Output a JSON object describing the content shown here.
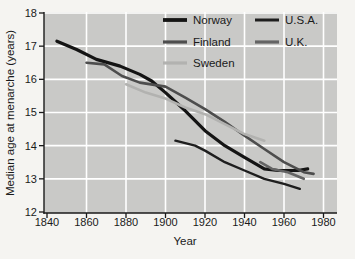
{
  "figure_title": "Secular trend in median age at menarche",
  "axes": {
    "y_title": "Median age at menarche (years)",
    "x_title": "Year",
    "y_ticks": [
      12,
      13,
      14,
      15,
      16,
      17,
      18
    ],
    "x_ticks": [
      1840,
      1860,
      1880,
      1900,
      1920,
      1940,
      1960,
      1980
    ]
  },
  "colors": {
    "plot_background": "#c9c9c7",
    "page_background": "#f5f4f1",
    "gridline": "#ffffff",
    "axis": "#1a1a1a",
    "norway": "#141414",
    "finland": "#4d4d4d",
    "sweden": "#b2b2b0",
    "usa": "#1e1e1e",
    "uk": "#646464"
  },
  "legend": {
    "items": [
      {
        "label": "Norway",
        "series": "Norway",
        "col": 0,
        "row": 0
      },
      {
        "label": "Finland",
        "series": "Finland",
        "col": 0,
        "row": 1
      },
      {
        "label": "Sweden",
        "series": "Sweden",
        "col": 0,
        "row": 2
      },
      {
        "label": "U.S.A.",
        "series": "U.S.A.",
        "col": 1,
        "row": 0
      },
      {
        "label": "U.K.",
        "series": "U.K.",
        "col": 1,
        "row": 1
      }
    ]
  },
  "chart_data": {
    "type": "line",
    "title": "",
    "xlabel": "Year",
    "ylabel": "Median age at menarche (years)",
    "xlim": [
      1838,
      1987
    ],
    "ylim": [
      12,
      18
    ],
    "grid": true,
    "legend_position": "top-inside-two-columns",
    "series": [
      {
        "name": "Norway",
        "color": "#141414",
        "stroke_width": 3.2,
        "points": [
          [
            1845,
            17.15
          ],
          [
            1855,
            16.9
          ],
          [
            1865,
            16.6
          ],
          [
            1877,
            16.4
          ],
          [
            1887,
            16.15
          ],
          [
            1893,
            15.95
          ],
          [
            1900,
            15.6
          ],
          [
            1910,
            15.05
          ],
          [
            1920,
            14.45
          ],
          [
            1930,
            14.0
          ],
          [
            1940,
            13.65
          ],
          [
            1950,
            13.3
          ],
          [
            1957,
            13.25
          ],
          [
            1967,
            13.25
          ],
          [
            1972,
            13.3
          ]
        ]
      },
      {
        "name": "Finland",
        "color": "#4d4d4d",
        "stroke_width": 2.6,
        "points": [
          [
            1860,
            16.5
          ],
          [
            1869,
            16.45
          ],
          [
            1878,
            16.1
          ],
          [
            1887,
            15.9
          ],
          [
            1900,
            15.78
          ],
          [
            1910,
            15.45
          ],
          [
            1920,
            15.1
          ],
          [
            1930,
            14.72
          ],
          [
            1940,
            14.3
          ],
          [
            1950,
            13.9
          ],
          [
            1960,
            13.5
          ],
          [
            1970,
            13.2
          ],
          [
            1975,
            13.15
          ]
        ]
      },
      {
        "name": "Sweden",
        "color": "#b2b2b0",
        "stroke_width": 2.6,
        "points": [
          [
            1880,
            15.85
          ],
          [
            1890,
            15.6
          ],
          [
            1900,
            15.42
          ],
          [
            1910,
            15.15
          ],
          [
            1920,
            14.95
          ],
          [
            1930,
            14.65
          ],
          [
            1940,
            14.35
          ],
          [
            1950,
            14.15
          ]
        ]
      },
      {
        "name": "U.S.A.",
        "color": "#1e1e1e",
        "stroke_width": 2.4,
        "points": [
          [
            1905,
            14.15
          ],
          [
            1915,
            14.0
          ],
          [
            1920,
            13.85
          ],
          [
            1930,
            13.5
          ],
          [
            1940,
            13.25
          ],
          [
            1950,
            13.0
          ],
          [
            1960,
            12.85
          ],
          [
            1968,
            12.7
          ]
        ]
      },
      {
        "name": "U.K.",
        "color": "#646464",
        "stroke_width": 2.6,
        "points": [
          [
            1948,
            13.5
          ],
          [
            1954,
            13.3
          ],
          [
            1962,
            13.2
          ],
          [
            1970,
            13.0
          ]
        ]
      }
    ]
  }
}
